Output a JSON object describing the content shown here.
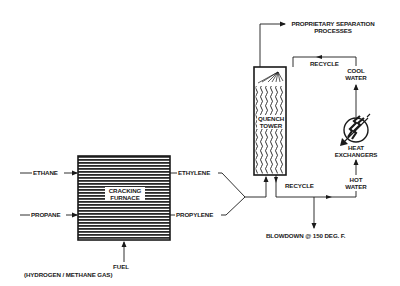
{
  "diagram": {
    "type": "process-flow",
    "colors": {
      "ink": "#1a1a1a",
      "background": "#ffffff"
    },
    "nodes": {
      "furnace": {
        "label_line1": "CRACKING",
        "label_line2": "FURNACE"
      },
      "tower": {
        "label_line1": "QUENCH",
        "label_line2": "TOWER"
      },
      "heat_exchanger": {
        "label_line1": "HEAT",
        "label_line2": "EXCHANGERS"
      }
    },
    "labels": {
      "ethane": "ETHANE",
      "propane": "PROPANE",
      "ethylene": "ETHYLENE",
      "propylene": "PROPYLENE",
      "fuel": "FUEL",
      "fuel_detail": "(HYDROGEN / METHANE GAS)",
      "separation_line1": "PROPRIETARY SEPARATION",
      "separation_line2": "PROCESSES",
      "recycle_top": "RECYCLE",
      "recycle_bottom": "RECYCLE",
      "cool_water_line1": "COOL",
      "cool_water_line2": "WATER",
      "hot_water_line1": "HOT",
      "hot_water_line2": "WATER",
      "blowdown": "BLOWDOWN @ 150  DEG. F."
    }
  }
}
